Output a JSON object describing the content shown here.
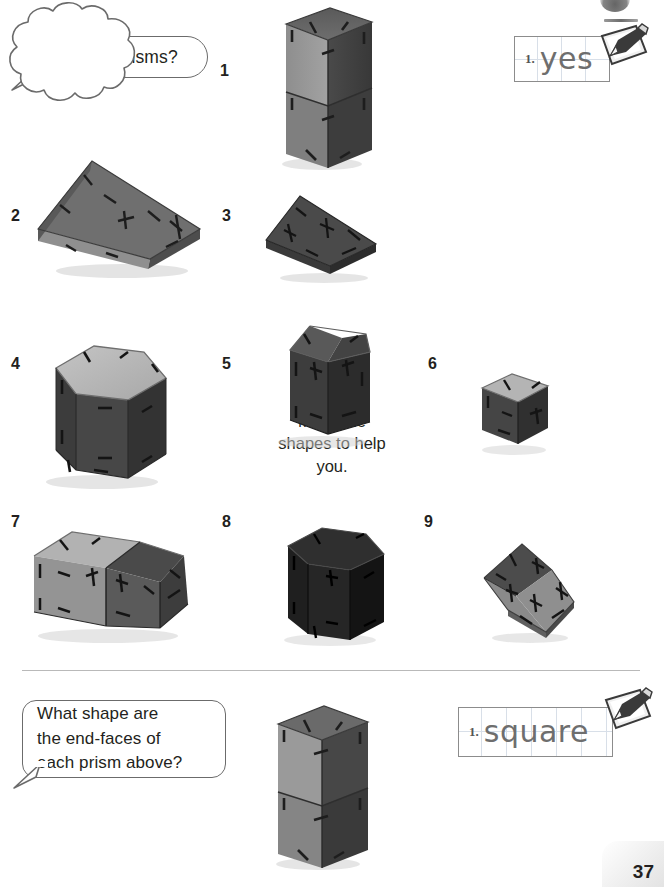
{
  "page": {
    "number": "37",
    "top_badge_icon": "partial-circle-badge"
  },
  "bubbles": {
    "question_prisms": {
      "text": "Are these prisms?",
      "style": "rounded-rectangle-with-tail"
    },
    "hint_cloud": {
      "text": "Make the\nshapes to help\nyou.",
      "style": "cloud"
    },
    "question_endfaces": {
      "text": "What shape are\nthe end-faces of\neach prism above?",
      "style": "rounded-rectangle-with-tail"
    }
  },
  "answers": {
    "top": {
      "number": "1.",
      "value": "yes",
      "placeholder": "write your answer",
      "icon": "pencil-notepad-icon"
    },
    "bottom": {
      "number": "1.",
      "value": "square",
      "placeholder": "write your answer",
      "icon": "pencil-notepad-icon"
    }
  },
  "shapes": [
    {
      "label": "1",
      "name": "tall-cuboid-prism",
      "desc": "tall rectangular prism of two stacked cubes"
    },
    {
      "label": "2",
      "name": "flat-wedge-prism",
      "desc": "flat triangular wedge prism lying down"
    },
    {
      "label": "3",
      "name": "thin-rhombus-plate",
      "desc": "thin dark quadrilateral plate"
    },
    {
      "label": "4",
      "name": "hexagonal-prism",
      "desc": "hexagonal prism, light top face"
    },
    {
      "label": "5",
      "name": "pentagonal-prism",
      "desc": "dark pentagonal prism, house-shaped end"
    },
    {
      "label": "6",
      "name": "small-cube",
      "desc": "small cube, light top face"
    },
    {
      "label": "7",
      "name": "sloped-end-prism",
      "desc": "horizontal prism with sloping end"
    },
    {
      "label": "8",
      "name": "dark-hexagonal-prism",
      "desc": "very dark hexagonal prism"
    },
    {
      "label": "9",
      "name": "thin-square-plate",
      "desc": "thin tilted square plate"
    }
  ],
  "bottom_shape": {
    "name": "tall-cuboid-prism",
    "desc": "tall rectangular prism of two stacked cubes"
  },
  "colors": {
    "outline": "#6b6b6b",
    "text": "#231f20",
    "grid_line": "#d8dfe8",
    "handwriting": "#6e6e6e",
    "divider": "#b9b9b9",
    "shape_light": "#b9b9b9",
    "shape_mid": "#8a8a8a",
    "shape_dark": "#4f4f4f",
    "shape_darkest": "#2b2b2b"
  }
}
